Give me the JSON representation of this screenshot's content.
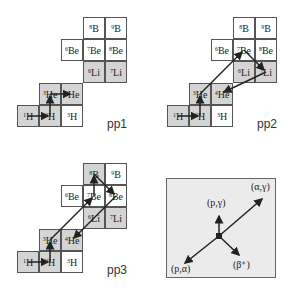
{
  "panels": [
    {
      "id": "pp1",
      "label": "pp1",
      "cells": {
        "B8": {
          "mass": "8",
          "sym": "B"
        },
        "B9": {
          "mass": "9",
          "sym": "B"
        },
        "Be6": {
          "mass": "6",
          "sym": "Be"
        },
        "Be7": {
          "mass": "7",
          "sym": "Be"
        },
        "Be8": {
          "mass": "8",
          "sym": "Be"
        },
        "Li6": {
          "mass": "6",
          "sym": "Li"
        },
        "Li7": {
          "mass": "7",
          "sym": "Li"
        },
        "He3": {
          "mass": "3",
          "sym": "He"
        },
        "He4": {
          "mass": "4",
          "sym": "He"
        },
        "H1": {
          "mass": "1",
          "sym": "H"
        },
        "H2": {
          "mass": "2",
          "sym": "H"
        },
        "H3": {
          "mass": "3",
          "sym": "H"
        }
      },
      "path": [
        "1H",
        "2H",
        "3He",
        "4He"
      ]
    },
    {
      "id": "pp2",
      "label": "pp2",
      "cells": {
        "B8": {
          "mass": "8",
          "sym": "B"
        },
        "B9": {
          "mass": "9",
          "sym": "B"
        },
        "Be6": {
          "mass": "6",
          "sym": "Be"
        },
        "Be7": {
          "mass": "7",
          "sym": "Be"
        },
        "Be8": {
          "mass": "8",
          "sym": "Be"
        },
        "Li6": {
          "mass": "6",
          "sym": "Li"
        },
        "Li7": {
          "mass": "7",
          "sym": "Li"
        },
        "He3": {
          "mass": "3",
          "sym": "He"
        },
        "He4": {
          "mass": "4",
          "sym": "He"
        },
        "H1": {
          "mass": "1",
          "sym": "H"
        },
        "H2": {
          "mass": "2",
          "sym": "H"
        },
        "H3": {
          "mass": "3",
          "sym": "H"
        }
      },
      "path": [
        "1H",
        "2H",
        "3He",
        "7Be",
        "7Li",
        "4He"
      ]
    },
    {
      "id": "pp3",
      "label": "pp3",
      "cells": {
        "B8": {
          "mass": "8",
          "sym": "B"
        },
        "B9": {
          "mass": "9",
          "sym": "B"
        },
        "Be6": {
          "mass": "6",
          "sym": "Be"
        },
        "Be7": {
          "mass": "7",
          "sym": "Be"
        },
        "Be8": {
          "mass": "8",
          "sym": "Be"
        },
        "Li6": {
          "mass": "6",
          "sym": "Li"
        },
        "Li7": {
          "mass": "7",
          "sym": "Li"
        },
        "He3": {
          "mass": "3",
          "sym": "He"
        },
        "He4": {
          "mass": "4",
          "sym": "He"
        },
        "H1": {
          "mass": "1",
          "sym": "H"
        },
        "H2": {
          "mass": "2",
          "sym": "H"
        },
        "H3": {
          "mass": "3",
          "sym": "H"
        }
      },
      "path": [
        "1H",
        "2H",
        "3He",
        "7Be",
        "8B",
        "8Be",
        "4He"
      ]
    }
  ],
  "legend": {
    "alpha_gamma": "(α,γ)",
    "p_gamma": "(p,γ)",
    "p_alpha": "(p,α)",
    "beta_plus": "(β⁺)"
  },
  "colors": {
    "shaded": "#d4d4d4",
    "border": "#555555",
    "legend_bg": "#ebebeb",
    "arrow": "#222222"
  }
}
